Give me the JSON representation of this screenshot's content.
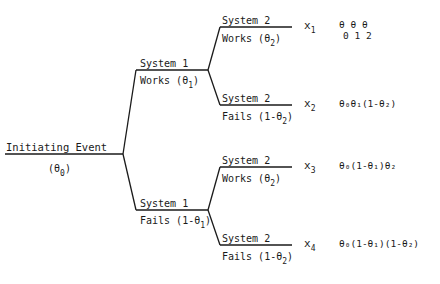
{
  "diagram": {
    "type": "event-tree",
    "initiating_event": {
      "label": "Initiating Event",
      "prob_symbol": "θ",
      "prob_sub": "0"
    },
    "system1": {
      "works": {
        "title": "System 1",
        "label": "Works (θ",
        "sub": "1",
        "close": ")"
      },
      "fails": {
        "title": "System 1",
        "label": "Fails (1-θ",
        "sub": "1",
        "close": ")"
      }
    },
    "system2": {
      "branch1": {
        "title": "System 2",
        "label": "Works (θ",
        "sub": "2",
        "close": ")"
      },
      "branch2": {
        "title": "System 2",
        "label": "Fails (1-θ",
        "sub": "2",
        "close": ")"
      },
      "branch3": {
        "title": "System 2",
        "label": "Works (θ",
        "sub": "2",
        "close": ")"
      },
      "branch4": {
        "title": "System 2",
        "label": "Fails (1-θ",
        "sub": "2",
        "close": ")"
      }
    },
    "outcomes": [
      {
        "var": "x",
        "sub": "1",
        "expr_top": "θ θ θ",
        "expr_bottom": "0 1 2"
      },
      {
        "var": "x",
        "sub": "2",
        "expr": "θ₀θ₁(1-θ₂)"
      },
      {
        "var": "x",
        "sub": "3",
        "expr": "θ₀(1-θ₁)θ₂"
      },
      {
        "var": "x",
        "sub": "4",
        "expr": "θ₀(1-θ₁)(1-θ₂)"
      }
    ],
    "line_color": "#1a1a1a"
  }
}
